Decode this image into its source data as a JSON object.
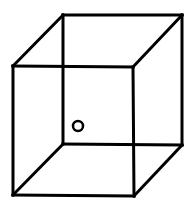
{
  "diagram": {
    "type": "wireframe-cube",
    "stroke_color": "#000000",
    "background": "#ffffff",
    "stroke_width": 3,
    "vertices": {
      "back_top_left": [
        63,
        15
      ],
      "back_top_right": [
        182,
        15
      ],
      "back_bottom_left": [
        63,
        144
      ],
      "back_bottom_right": [
        182,
        145
      ],
      "front_top_left": [
        13,
        66
      ],
      "front_top_right": [
        133,
        67
      ],
      "front_bottom_left": [
        13,
        195
      ],
      "front_bottom_right": [
        134,
        196
      ]
    },
    "marker": {
      "shape": "circle",
      "center": [
        78,
        126
      ],
      "radius": 5
    }
  }
}
